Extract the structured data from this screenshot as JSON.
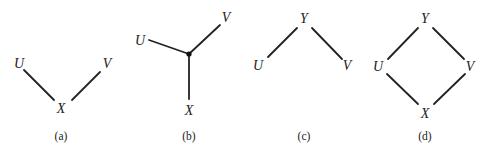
{
  "figures": [
    {
      "id": "a",
      "caption": "(a)",
      "nodes": [
        {
          "name": "U",
          "label": "U",
          "x": 19,
          "y": 68
        },
        {
          "name": "V",
          "label": "V",
          "x": 107,
          "y": 68
        },
        {
          "name": "X",
          "label": "X",
          "x": 61,
          "y": 113
        }
      ],
      "edges": [
        [
          "U",
          "X"
        ],
        [
          "V",
          "X"
        ]
      ]
    },
    {
      "id": "b",
      "caption": "(b)",
      "nodes": [
        {
          "name": "U",
          "label": "U",
          "x": 140,
          "y": 45
        },
        {
          "name": "V",
          "label": "V",
          "x": 226,
          "y": 22
        },
        {
          "name": "center",
          "label": "",
          "x": 189,
          "y": 54
        },
        {
          "name": "X",
          "label": "X",
          "x": 189,
          "y": 115
        }
      ],
      "edges": [
        [
          "U",
          "center"
        ],
        [
          "V",
          "center"
        ],
        [
          "center",
          "X"
        ]
      ]
    },
    {
      "id": "c",
      "caption": "(c)",
      "nodes": [
        {
          "name": "Y",
          "label": "Y",
          "x": 304,
          "y": 23
        },
        {
          "name": "U",
          "label": "U",
          "x": 258,
          "y": 70
        },
        {
          "name": "V",
          "label": "V",
          "x": 347,
          "y": 70
        }
      ],
      "edges": [
        [
          "Y",
          "U"
        ],
        [
          "Y",
          "V"
        ]
      ]
    },
    {
      "id": "d",
      "caption": "(d)",
      "nodes": [
        {
          "name": "Y",
          "label": "Y",
          "x": 425,
          "y": 23
        },
        {
          "name": "U",
          "label": "U",
          "x": 378,
          "y": 71
        },
        {
          "name": "V",
          "label": "V",
          "x": 470,
          "y": 71
        },
        {
          "name": "X",
          "label": "X",
          "x": 425,
          "y": 118
        }
      ],
      "edges": [
        [
          "Y",
          "U"
        ],
        [
          "Y",
          "V"
        ],
        [
          "U",
          "X"
        ],
        [
          "V",
          "X"
        ]
      ]
    }
  ]
}
